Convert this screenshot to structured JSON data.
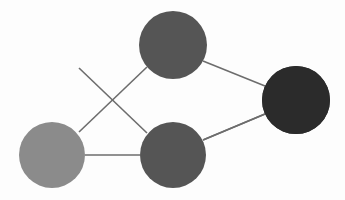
{
  "diagram": {
    "type": "node-link-diagram",
    "canvas": {
      "width": 345,
      "height": 200,
      "background_color": "#fdfdfd"
    },
    "style": {
      "edge_color": "#6d6d6d",
      "edge_width": 1.6,
      "node_border": "none"
    },
    "layers": [
      {
        "name": "input-layer",
        "node_count": 2,
        "fill": "#8b8b8b"
      },
      {
        "name": "hidden-layer",
        "node_count": 2,
        "fill": "#555555"
      },
      {
        "name": "output-layer",
        "node_count": 1,
        "fill": "#2b2b2b"
      }
    ],
    "nodes": [
      {
        "id": "in-1",
        "layer": "input-layer",
        "cx": 52,
        "cy": 46,
        "r": 33,
        "fill": "#8b8b8b",
        "label": ""
      },
      {
        "id": "in-2",
        "layer": "input-layer",
        "cx": 52,
        "cy": 155,
        "r": 33,
        "fill": "#8b8b8b",
        "label": ""
      },
      {
        "id": "hid-1",
        "layer": "hidden-layer",
        "cx": 173,
        "cy": 45,
        "r": 34,
        "fill": "#555555",
        "label": ""
      },
      {
        "id": "hid-2",
        "layer": "hidden-layer",
        "cx": 173,
        "cy": 155,
        "r": 33,
        "fill": "#555555",
        "label": ""
      },
      {
        "id": "out-1",
        "layer": "output-layer",
        "cx": 296,
        "cy": 100,
        "r": 34,
        "fill": "#2b2b2b",
        "label": ""
      }
    ],
    "edges": [
      {
        "id": "edge-in1-hid1",
        "from": "in-1",
        "to": "hid-1",
        "x1": 85,
        "y1": 45,
        "x2": 140,
        "y2": 45
      },
      {
        "id": "edge-in1-hid2",
        "from": "in-1",
        "to": "hid-2",
        "x1": 79,
        "y1": 68,
        "x2": 147,
        "y2": 133
      },
      {
        "id": "edge-in2-hid1",
        "from": "in-2",
        "to": "hid-1",
        "x1": 79,
        "y1": 132,
        "x2": 147,
        "y2": 67
      },
      {
        "id": "edge-in2-hid2",
        "from": "in-2",
        "to": "hid-2",
        "x1": 85,
        "y1": 155,
        "x2": 140,
        "y2": 155
      },
      {
        "id": "edge-hid1-out1",
        "from": "hid-1",
        "to": "out-1",
        "x1": 203,
        "y1": 61,
        "x2": 265,
        "y2": 86
      },
      {
        "id": "edge-hid2-out1",
        "from": "hid-2",
        "to": "out-1",
        "x1": 203,
        "y1": 140,
        "x2": 265,
        "y2": 114
      }
    ]
  }
}
